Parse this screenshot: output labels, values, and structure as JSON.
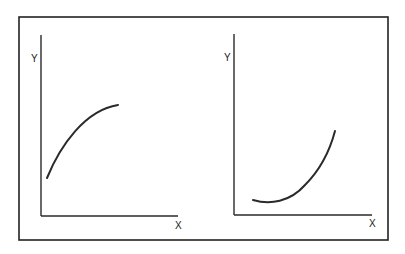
{
  "diagram": {
    "colors": {
      "stroke": "#2a2a2a",
      "background": "#ffffff"
    },
    "panels": [
      {
        "id": "left",
        "y_label": "Y",
        "x_label": "X",
        "curve_shape": "concave-down increasing (diminishing returns)",
        "curve_path": "M47,178 C60,146 85,110 118,105"
      },
      {
        "id": "right",
        "y_label": "Y",
        "x_label": "X",
        "curve_shape": "convex increasing (accelerating growth)",
        "curve_path": "M253,200 C270,205 290,202 305,185 C320,170 330,150 335,131"
      }
    ]
  }
}
